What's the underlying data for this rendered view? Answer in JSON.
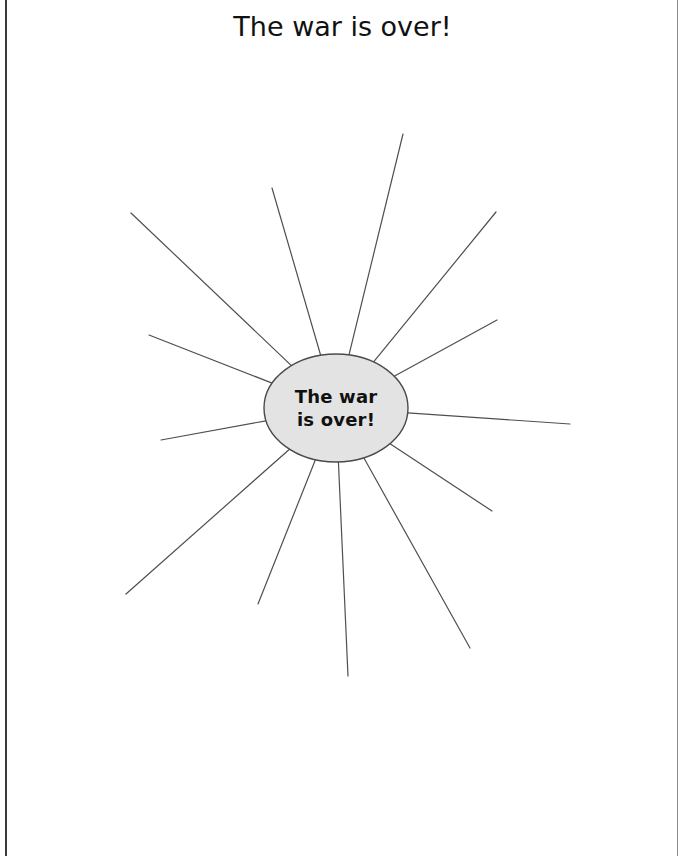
{
  "page": {
    "title": "The war is over!",
    "background_color": "#ffffff",
    "border_color": "#3a3a3a"
  },
  "organizer": {
    "type": "sunburst-web",
    "center": {
      "text_line_1": "The war",
      "text_line_2": "is over!",
      "fill_color": "#e3e3e3",
      "stroke_color": "#4a4a4a",
      "cx": 336,
      "cy": 408,
      "rx": 72,
      "ry": 54
    },
    "ray_color": "#4f4f4f",
    "ray_count": 12,
    "rays": [
      {
        "name": "ray-1",
        "x1": 331,
        "y1": 354,
        "x2": 272,
        "y2": 188
      },
      {
        "name": "ray-2",
        "x1": 350,
        "y1": 354,
        "x2": 403,
        "y2": 134
      },
      {
        "name": "ray-3",
        "x1": 378,
        "y1": 366,
        "x2": 496,
        "y2": 212
      },
      {
        "name": "ray-4",
        "x1": 400,
        "y1": 388,
        "x2": 497,
        "y2": 320
      },
      {
        "name": "ray-5",
        "x1": 408,
        "y1": 409,
        "x2": 570,
        "y2": 424
      },
      {
        "name": "ray-6",
        "x1": 399,
        "y1": 432,
        "x2": 492,
        "y2": 511
      },
      {
        "name": "ray-7",
        "x1": 374,
        "y1": 452,
        "x2": 470,
        "y2": 648
      },
      {
        "name": "ray-8",
        "x1": 344,
        "y1": 462,
        "x2": 348,
        "y2": 676
      },
      {
        "name": "ray-9",
        "x1": 310,
        "y1": 457,
        "x2": 258,
        "y2": 604
      },
      {
        "name": "ray-10",
        "x1": 281,
        "y1": 440,
        "x2": 126,
        "y2": 594
      },
      {
        "name": "ray-11",
        "x1": 268,
        "y1": 420,
        "x2": 161,
        "y2": 440
      },
      {
        "name": "ray-12",
        "x1": 272,
        "y1": 382,
        "x2": 149,
        "y2": 335
      },
      {
        "name": "ray-13",
        "x1": 281,
        "y1": 371,
        "x2": 131,
        "y2": 213
      }
    ]
  }
}
